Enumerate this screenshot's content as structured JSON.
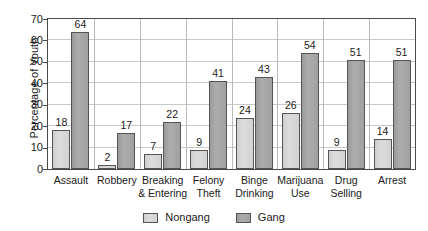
{
  "chart_data": {
    "type": "bar",
    "title": "",
    "subtitle": "",
    "xlabel": "",
    "ylabel": "Percentage of Youth",
    "ylim": [
      0,
      70
    ],
    "yticks": [
      0,
      10,
      20,
      30,
      40,
      50,
      60,
      70
    ],
    "grid": "horizontal",
    "legend_position": "bottom-center",
    "categories": [
      "Assault",
      "Robbery",
      "Breaking & Entering",
      "Felony Theft",
      "Binge Drinking",
      "Marijuana Use",
      "Drug Selling",
      "Arrest"
    ],
    "category_lines": [
      [
        "Assault"
      ],
      [
        "Robbery"
      ],
      [
        "Breaking",
        "& Entering"
      ],
      [
        "Felony",
        "Theft"
      ],
      [
        "Binge",
        "Drinking"
      ],
      [
        "Marijuana",
        "Use"
      ],
      [
        "Drug",
        "Selling"
      ],
      [
        "Arrest"
      ]
    ],
    "series": [
      {
        "name": "Nongang",
        "color": "#d6d6d6",
        "values": [
          18,
          2,
          7,
          9,
          24,
          26,
          9,
          14
        ]
      },
      {
        "name": "Gang",
        "color": "#a5a5a5",
        "values": [
          64,
          17,
          22,
          41,
          43,
          54,
          51,
          51
        ]
      }
    ]
  },
  "axis": {
    "y_title": "Percentage of Youth",
    "y_tick_labels": [
      "70",
      "60",
      "50",
      "40",
      "30",
      "20",
      "10",
      "0"
    ]
  },
  "legend": {
    "items": [
      {
        "label": "Nongang",
        "swatch": "nongang-swatch-icon"
      },
      {
        "label": "Gang",
        "swatch": "gang-swatch-icon"
      }
    ]
  }
}
